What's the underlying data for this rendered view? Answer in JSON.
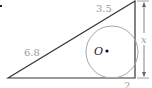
{
  "diagram": {
    "type": "right triangle with inscribed circle",
    "labels": {
      "hypotenuse_lower": "6.8",
      "hypotenuse_upper": "3.5",
      "bottom_segment": "2",
      "vertical_side": "x",
      "center": "O"
    },
    "colors": {
      "triangle_stroke": "#333333",
      "circle_stroke": "#9a9a9a",
      "label": "#9a9a9a",
      "dimension_arrow": "#666666"
    }
  }
}
